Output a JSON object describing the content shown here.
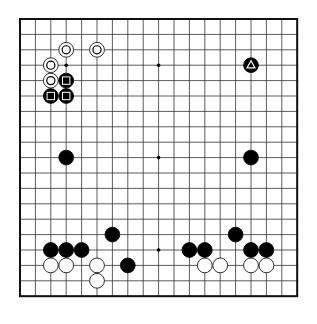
{
  "board": {
    "size": 19,
    "origin_x": 20,
    "origin_y": 19,
    "spacing": 15.4,
    "line_color": "#333333",
    "border_color": "#111111",
    "hoshi": [
      [
        3,
        3
      ],
      [
        9,
        3
      ],
      [
        15,
        3
      ],
      [
        3,
        9
      ],
      [
        9,
        9
      ],
      [
        15,
        9
      ],
      [
        3,
        15
      ],
      [
        9,
        15
      ],
      [
        15,
        15
      ]
    ]
  },
  "stones": [
    {
      "color": "white",
      "col": 3,
      "row": 2,
      "marker": "circle"
    },
    {
      "color": "white",
      "col": 5,
      "row": 2,
      "marker": "circle"
    },
    {
      "color": "white",
      "col": 2,
      "row": 3,
      "marker": "circle"
    },
    {
      "color": "white",
      "col": 2,
      "row": 4,
      "marker": "circle"
    },
    {
      "color": "black",
      "col": 3,
      "row": 4,
      "marker": "square"
    },
    {
      "color": "black",
      "col": 2,
      "row": 5,
      "marker": "square"
    },
    {
      "color": "black",
      "col": 3,
      "row": 5,
      "marker": "square"
    },
    {
      "color": "black",
      "col": 15,
      "row": 3,
      "marker": "triangle"
    },
    {
      "color": "black",
      "col": 3,
      "row": 9
    },
    {
      "color": "black",
      "col": 15,
      "row": 9
    },
    {
      "color": "black",
      "col": 6,
      "row": 14
    },
    {
      "color": "black",
      "col": 2,
      "row": 15
    },
    {
      "color": "black",
      "col": 3,
      "row": 15
    },
    {
      "color": "black",
      "col": 4,
      "row": 15
    },
    {
      "color": "black",
      "col": 7,
      "row": 16
    },
    {
      "color": "white",
      "col": 2,
      "row": 16
    },
    {
      "color": "white",
      "col": 3,
      "row": 16
    },
    {
      "color": "white",
      "col": 5,
      "row": 16
    },
    {
      "color": "white",
      "col": 5,
      "row": 17
    },
    {
      "color": "black",
      "col": 14,
      "row": 14
    },
    {
      "color": "black",
      "col": 11,
      "row": 15
    },
    {
      "color": "black",
      "col": 12,
      "row": 15
    },
    {
      "color": "black",
      "col": 15,
      "row": 15
    },
    {
      "color": "black",
      "col": 16,
      "row": 15
    },
    {
      "color": "white",
      "col": 12,
      "row": 16
    },
    {
      "color": "white",
      "col": 13,
      "row": 16
    },
    {
      "color": "white",
      "col": 15,
      "row": 16
    },
    {
      "color": "white",
      "col": 16,
      "row": 16
    }
  ]
}
